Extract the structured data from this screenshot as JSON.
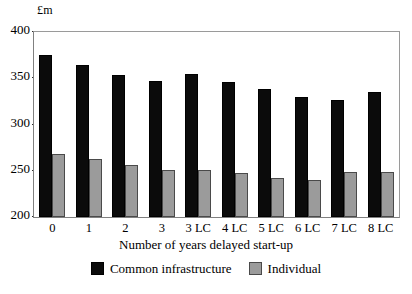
{
  "chart_data": {
    "type": "bar",
    "title": "",
    "subtitle": "",
    "xlabel": "Number of years delayed start-up",
    "ylabel": "£m",
    "ylim": [
      200,
      400
    ],
    "ytick_step": 50,
    "yticks": [
      400,
      350,
      300,
      250,
      200
    ],
    "grid": false,
    "legend_position": "bottom",
    "categories": [
      "0",
      "1",
      "2",
      "3",
      "3 LC",
      "4 LC",
      "5 LC",
      "6 LC",
      "7 LC",
      "8 LC"
    ],
    "series": [
      {
        "name": "Common infrastructure",
        "color": "#0b0b0b",
        "values": [
          375,
          364,
          354,
          347,
          355,
          346,
          338,
          330,
          326,
          335
        ]
      },
      {
        "name": "Individual",
        "color": "#9b9b9b",
        "values": [
          268,
          263,
          256,
          251,
          251,
          248,
          242,
          240,
          249,
          249
        ]
      }
    ]
  },
  "axis": {
    "y_unit_label": "£m",
    "x_title": "Number of years delayed start-up"
  }
}
